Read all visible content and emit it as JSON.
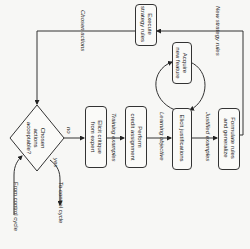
{
  "diagram": {
    "nodes": {
      "decision": "Chosen actions acceptable?",
      "execute": [
        "Execute",
        "strategy rules"
      ],
      "elicit_critique": [
        "Elicit critique",
        "from expert"
      ],
      "perform_credit": [
        "Perform",
        "credit assignment"
      ],
      "elicit_justifications": "Elicit justifications",
      "acquire_feature": [
        "Acquire",
        "new feature"
      ],
      "formulate_rules": [
        "Formulate rules",
        "and generalize"
      ]
    },
    "decision_lines": [
      "Chosen",
      "actions",
      "acceptable?"
    ],
    "edges": {
      "chosen_actions": "Chosen actions",
      "new_strategy_rules": "New strategy rules",
      "training_examples": "Training examples",
      "learning_objective": "Learning objective",
      "justified_examples": "Justified examples",
      "no": "no",
      "yes": "yes",
      "from_control": "From control cycle",
      "to_control": "To control cycle"
    }
  }
}
